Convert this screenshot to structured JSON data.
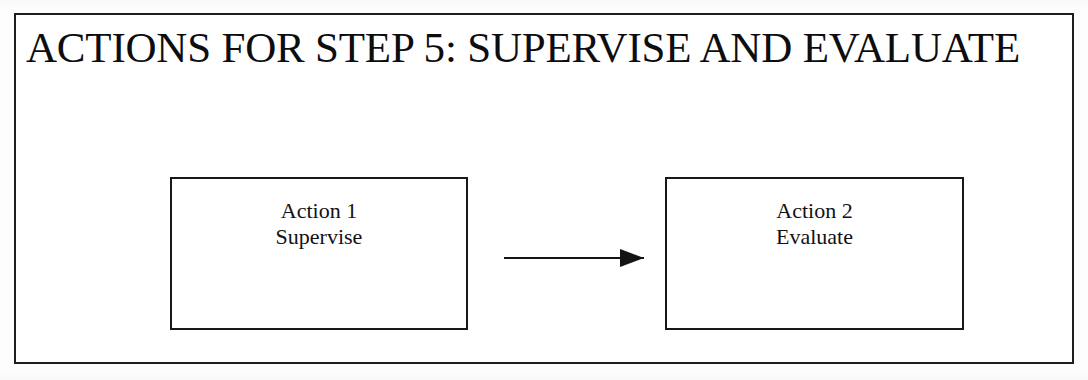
{
  "document": {
    "title": "ACTIONS FOR STEP 5: SUPERVISE AND EVALUATE",
    "type": "flow-diagram"
  },
  "colors": {
    "ink": "#18181a",
    "page_background": "#ffffff",
    "frame_border": "#1e1e20"
  },
  "diagram": {
    "nodes": [
      {
        "id": "action-1",
        "line1": "Action 1",
        "line2": "Supervise"
      },
      {
        "id": "action-2",
        "line1": "Action 2",
        "line2": "Evaluate"
      }
    ],
    "connectors": [
      {
        "id": "arrow-action1-to-action2",
        "from": "action-1",
        "to": "action-2",
        "style": "solid-line-with-filled-arrowhead",
        "direction": "left-to-right"
      }
    ]
  }
}
